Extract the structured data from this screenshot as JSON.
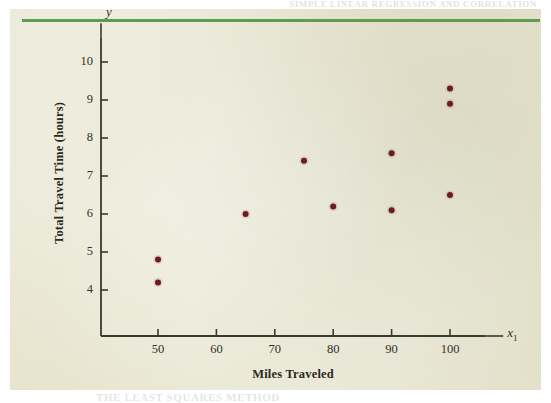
{
  "page": {
    "background_color": "#e6e4cd",
    "rule_color": "#5f9c4e",
    "ghost_header_text": "SIMPLE LINEAR REGRESSION AND CORRELATION",
    "ghost_footer_text": "THE LEAST SQUARES METHOD"
  },
  "chart_data": {
    "type": "scatter",
    "title": "",
    "xlabel": "Miles Traveled",
    "ylabel": "Total Travel Time (hours)",
    "x_axis_variable": "x",
    "x_axis_variable_subscript": "1",
    "y_axis_variable": "y",
    "xlim": [
      40,
      105
    ],
    "ylim": [
      3.4,
      10.6
    ],
    "x_ticks": [
      50,
      60,
      70,
      80,
      90,
      100
    ],
    "y_ticks": [
      4,
      5,
      6,
      7,
      8,
      9,
      10
    ],
    "x_tick_labels": [
      "50",
      "60",
      "70",
      "80",
      "90",
      "100"
    ],
    "y_tick_labels": [
      "4",
      "5",
      "6",
      "7",
      "8",
      "9",
      "10"
    ],
    "grid": false,
    "legend": false,
    "marker_color": "#6b1d1d",
    "marker_size": 6,
    "axis_color": "#3c3931",
    "points": [
      {
        "x": 50,
        "y": 4.8
      },
      {
        "x": 50,
        "y": 4.2
      },
      {
        "x": 65,
        "y": 6.0
      },
      {
        "x": 75,
        "y": 7.4
      },
      {
        "x": 80,
        "y": 6.2
      },
      {
        "x": 90,
        "y": 7.6
      },
      {
        "x": 90,
        "y": 6.1
      },
      {
        "x": 100,
        "y": 9.3
      },
      {
        "x": 100,
        "y": 8.9
      },
      {
        "x": 100,
        "y": 6.5
      }
    ]
  }
}
